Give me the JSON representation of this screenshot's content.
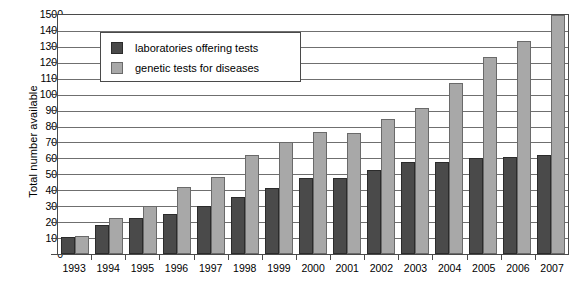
{
  "chart_data": {
    "type": "bar",
    "title": "",
    "xlabel": "",
    "ylabel": "Total number available",
    "ylim": [
      0,
      1500
    ],
    "ytick_step": 100,
    "grid": true,
    "legend_position": "upper-left-inside",
    "categories": [
      "1993",
      "1994",
      "1995",
      "1996",
      "1997",
      "1998",
      "1999",
      "2000",
      "2001",
      "2002",
      "2003",
      "2004",
      "2005",
      "2006",
      "2007"
    ],
    "series": [
      {
        "name": "laboratories offering tests",
        "color": "#4a4a4a",
        "values": [
          105,
          185,
          225,
          250,
          300,
          355,
          415,
          480,
          475,
          530,
          575,
          575,
          600,
          610,
          620
        ]
      },
      {
        "name": "genetic tests for diseases",
        "color": "#a8a8a8",
        "values": [
          110,
          225,
          300,
          420,
          485,
          620,
          705,
          765,
          760,
          845,
          915,
          1075,
          1235,
          1340,
          1500
        ]
      }
    ],
    "ytick_labels": [
      "1500",
      "1400",
      "1300",
      "1200",
      "1100",
      "1000",
      "900",
      "800",
      "700",
      "600",
      "500",
      "400",
      "300",
      "200",
      "100",
      "0"
    ]
  },
  "legend": {
    "items": [
      {
        "label": "laboratories offering tests",
        "swatch": "dark-gray-swatch"
      },
      {
        "label": "genetic tests for diseases",
        "swatch": "light-gray-swatch"
      }
    ]
  },
  "axes": {
    "y_title": "Total number available"
  }
}
